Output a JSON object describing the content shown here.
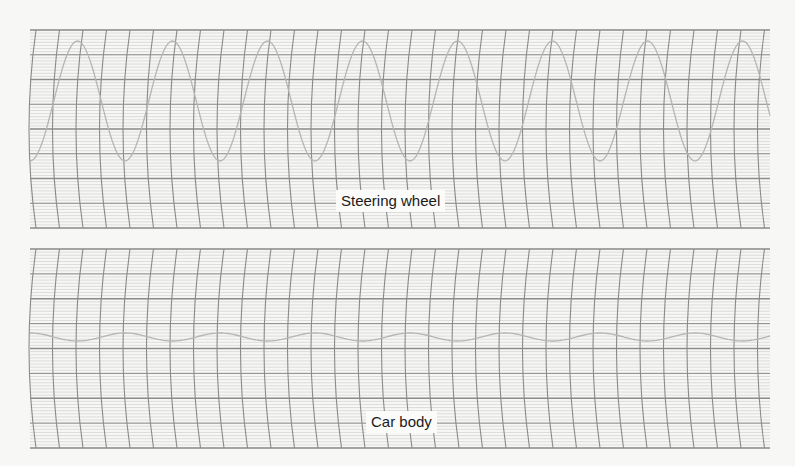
{
  "chart_data": [
    {
      "type": "line",
      "title": "Steering wheel",
      "label": "Steering wheel",
      "description": "Strip-chart recording of steering wheel oscillation",
      "panel": {
        "x0": 30,
        "x1": 770,
        "y0": 30,
        "y1": 228
      },
      "grid": true,
      "major_rows": 8,
      "waveform": {
        "shape": "sinusoid",
        "period_px": 95,
        "center_y": 101,
        "amplitude_px": 60,
        "phase_start_x": 30,
        "start_value": "trough"
      },
      "xlabel": "",
      "ylabel": ""
    },
    {
      "type": "line",
      "title": "Car body",
      "label": "Car body",
      "description": "Strip-chart recording of car body motion (near-flat small oscillation)",
      "panel": {
        "x0": 30,
        "x1": 770,
        "y0": 249,
        "y1": 448
      },
      "grid": true,
      "major_rows": 8,
      "waveform": {
        "shape": "sinusoid",
        "period_px": 95,
        "center_y": 337,
        "amplitude_px": 4,
        "phase_start_x": 30,
        "start_value": "peak"
      },
      "xlabel": "",
      "ylabel": ""
    }
  ],
  "labels": {
    "steering": "Steering wheel",
    "car_body": "Car body"
  },
  "colors": {
    "background": "#f7f7f5",
    "major_grid": "#8c8c8c",
    "minor_grid": "#c9c9c9",
    "vertical_arcs": "#8a8a8a",
    "trace": "#b5b5b5"
  }
}
